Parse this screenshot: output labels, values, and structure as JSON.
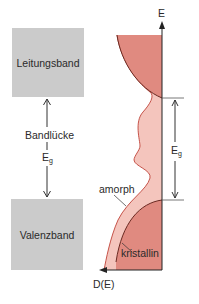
{
  "left_scheme": {
    "conduction_band_label": "Leitungsband",
    "valence_band_label": "Valenzband",
    "gap_label": "Bandlücke",
    "gap_symbol": "E",
    "gap_symbol_subscript": "g"
  },
  "dos_plot": {
    "y_axis_label": "E",
    "x_axis_label": "D(E)",
    "gap_symbol": "E",
    "gap_symbol_subscript": "g",
    "curve_labels": {
      "amorphous": "amorph",
      "crystalline": "kristallin"
    }
  },
  "colors": {
    "band_box_fill": "#cbcbcb",
    "crystalline_fill": "#e08a80",
    "amorphous_fill": "#f4c5bd",
    "crystalline_edge": "#6b2a22",
    "amorphous_edge": "#c0443a",
    "axis": "#222222"
  }
}
